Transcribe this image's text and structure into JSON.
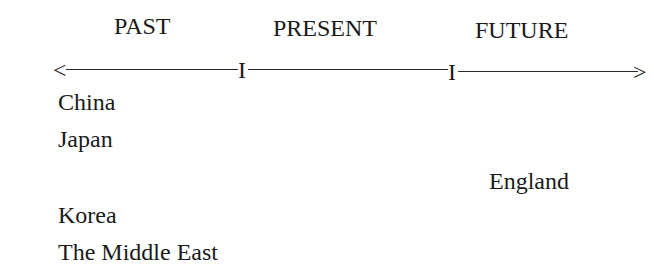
{
  "timeline": {
    "periods": [
      {
        "label": "PAST"
      },
      {
        "label": "PRESENT"
      },
      {
        "label": "FUTURE"
      }
    ],
    "arrow_left": "<",
    "arrow_right": ">",
    "tick_mark": "I"
  },
  "items": {
    "past": [
      "China",
      "Japan",
      "Korea",
      "The Middle East"
    ],
    "future": [
      "England"
    ]
  }
}
